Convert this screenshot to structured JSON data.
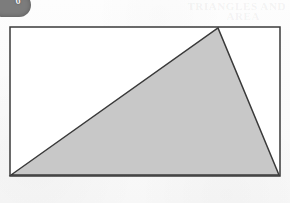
{
  "page": {
    "width": 290,
    "height": 203,
    "background_color": "#fbfbfb"
  },
  "badge": {
    "name": "exercise-number-badge",
    "number": "6",
    "fill_color": "#7c7c7c",
    "text_color": "#f2f2f2"
  },
  "ghost_header": {
    "line1": "TRIANGLES AND",
    "line2": "AREA"
  },
  "figure": {
    "title": "Shaded triangle inscribed in a rectangle",
    "stroke_color": "#3a3a3a",
    "stroke_width": 1.5,
    "rectangle": {
      "name": "bounding-rectangle",
      "fill_color": "#ffffff",
      "x": 10,
      "y": 27,
      "width": 270,
      "height": 149,
      "corners": [
        [
          10,
          27
        ],
        [
          280,
          27
        ],
        [
          280,
          176
        ],
        [
          10,
          176
        ]
      ]
    },
    "triangle": {
      "name": "shaded-triangle",
      "fill_color": "#c8c8c8",
      "vertices": [
        [
          11,
          175
        ],
        [
          218,
          28
        ],
        [
          279,
          175
        ]
      ],
      "vertex_labels": [
        "bottom-left-corner",
        "apex-on-top-edge",
        "bottom-right-corner"
      ]
    }
  }
}
